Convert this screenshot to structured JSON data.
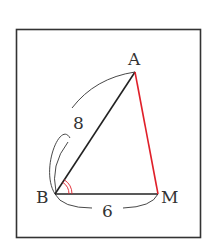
{
  "diagram": {
    "type": "triangle",
    "points": {
      "A": {
        "label": "A",
        "x": 135,
        "y": 72
      },
      "B": {
        "label": "B",
        "x": 55,
        "y": 194
      },
      "M": {
        "label": "M",
        "x": 158,
        "y": 194
      }
    },
    "segments": [
      {
        "from": "B",
        "to": "A",
        "color": "#222222",
        "length_label": "8"
      },
      {
        "from": "B",
        "to": "M",
        "color": "#222222",
        "length_label": "6"
      },
      {
        "from": "A",
        "to": "M",
        "color": "#e0202a",
        "length_label": ""
      }
    ],
    "angle_mark": {
      "vertex": "B",
      "arcs": 2,
      "color": "#e0202a"
    },
    "labels": {
      "A": "A",
      "B": "B",
      "M": "M",
      "AB_length": "8",
      "BM_length": "6"
    },
    "colors": {
      "frame": "#333333",
      "line": "#222222",
      "highlight": "#e0202a"
    }
  }
}
